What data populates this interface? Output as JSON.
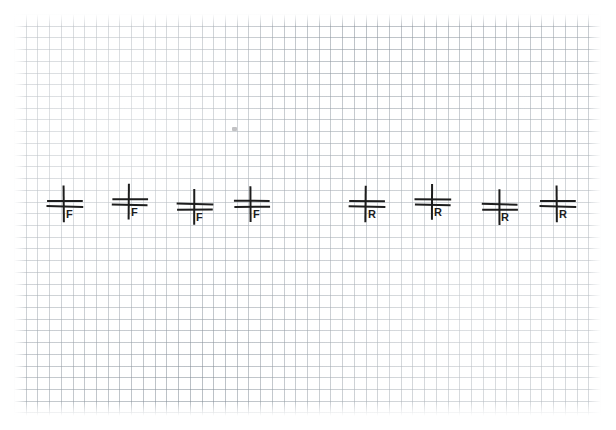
{
  "page": {
    "width": 616,
    "height": 430,
    "background_color": "#ffffff",
    "medium": "graph-paper-scan"
  },
  "grid": {
    "line_color": "#828c96",
    "cell_size_px": 11.72,
    "left": 14,
    "top": 14,
    "width": 587,
    "height": 402,
    "columns": 50,
    "rows": 34
  },
  "ink": {
    "color": "#1d1d1d",
    "stroke_width": 2
  },
  "stray_mark": {
    "label": "faint-pencil-smudge",
    "x": 232,
    "y": 127
  },
  "symbols": [
    {
      "id": "symbol-f-1",
      "label": "F",
      "group": "F",
      "x": 44,
      "y": 184,
      "index": 1
    },
    {
      "id": "symbol-f-2",
      "label": "F",
      "group": "F",
      "x": 109,
      "y": 182,
      "index": 2
    },
    {
      "id": "symbol-f-3",
      "label": "F",
      "group": "F",
      "x": 174,
      "y": 187,
      "index": 3
    },
    {
      "id": "symbol-f-4",
      "label": "F",
      "group": "F",
      "x": 231,
      "y": 184,
      "index": 4
    },
    {
      "id": "symbol-r-1",
      "label": "R",
      "group": "R",
      "x": 346,
      "y": 184,
      "index": 5
    },
    {
      "id": "symbol-r-2",
      "label": "R",
      "group": "R",
      "x": 412,
      "y": 182,
      "index": 6
    },
    {
      "id": "symbol-r-3",
      "label": "R",
      "group": "R",
      "x": 479,
      "y": 187,
      "index": 7
    },
    {
      "id": "symbol-r-4",
      "label": "R",
      "group": "R",
      "x": 537,
      "y": 184,
      "index": 8
    }
  ],
  "groups": {
    "f_group_label": "F",
    "r_group_label": "R",
    "f_count": 4,
    "r_count": 4,
    "total_count": 8
  }
}
